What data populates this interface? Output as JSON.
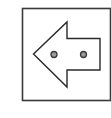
{
  "icon": {
    "semantic": "back-arrow-icon",
    "frame_color": "#3a3a3a",
    "arrow_stroke_color": "#2a2a2a",
    "arrow_fill_color": "#ffffff",
    "dot_ring_color": "#3a3a3a",
    "dot_fill_color": "#9a9a9a",
    "background_color": "#ffffff"
  }
}
